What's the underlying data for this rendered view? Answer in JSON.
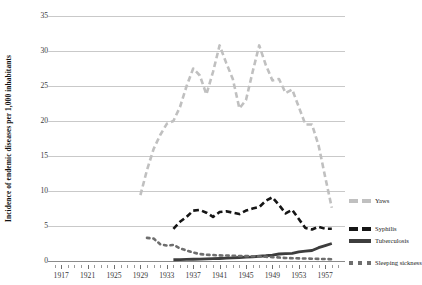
{
  "chart_data": {
    "type": "line",
    "title": "",
    "xlabel": "",
    "ylabel": "Incidence of endemic diseases per 1,000 inhabitants",
    "xlim": [
      1915,
      1960
    ],
    "ylim": [
      0,
      35
    ],
    "y_ticks": [
      0,
      5,
      10,
      15,
      20,
      25,
      30,
      35
    ],
    "x_ticks": [
      1917,
      1921,
      1925,
      1929,
      1933,
      1937,
      1941,
      1945,
      1949,
      1953,
      1957
    ],
    "x_minor_tick_interval": 1,
    "grid": "horizontal",
    "legend_position": "right",
    "series": [
      {
        "name": "Yaws",
        "color": "#c0c0c0",
        "style": "dashed",
        "width": 2.6,
        "x": [
          1929,
          1930,
          1931,
          1932,
          1933,
          1934,
          1935,
          1936,
          1937,
          1938,
          1939,
          1940,
          1941,
          1942,
          1943,
          1944,
          1945,
          1946,
          1947,
          1948,
          1949,
          1950,
          1951,
          1952,
          1953,
          1954,
          1955,
          1956,
          1957,
          1958
        ],
        "values": [
          9.4,
          13.0,
          16.0,
          18.0,
          19.6,
          20.0,
          22.0,
          25.0,
          27.5,
          26.5,
          23.8,
          27.0,
          30.8,
          28.3,
          26.0,
          21.8,
          23.0,
          27.0,
          30.8,
          28.0,
          25.8,
          26.0,
          24.0,
          24.5,
          22.0,
          19.5,
          19.5,
          16.5,
          12.0,
          7.6
        ]
      },
      {
        "name": "Syphilis",
        "color": "#151515",
        "style": "dashed",
        "width": 2.6,
        "x": [
          1934,
          1935,
          1936,
          1937,
          1938,
          1939,
          1940,
          1941,
          1942,
          1943,
          1944,
          1945,
          1946,
          1947,
          1948,
          1949,
          1950,
          1951,
          1952,
          1953,
          1954,
          1955,
          1956,
          1957,
          1958
        ],
        "values": [
          4.6,
          5.6,
          6.3,
          7.2,
          7.3,
          6.9,
          6.3,
          7.0,
          7.1,
          6.9,
          6.7,
          7.2,
          7.5,
          7.7,
          8.6,
          9.1,
          8.0,
          6.8,
          7.3,
          6.0,
          4.7,
          4.5,
          4.9,
          4.6,
          4.6
        ]
      },
      {
        "name": "Tuberculosis",
        "color": "#3d3d3d",
        "style": "solid",
        "width": 2.8,
        "x": [
          1934,
          1935,
          1936,
          1937,
          1938,
          1939,
          1940,
          1941,
          1942,
          1943,
          1944,
          1945,
          1946,
          1947,
          1948,
          1949,
          1950,
          1951,
          1952,
          1953,
          1954,
          1955,
          1956,
          1957,
          1958
        ],
        "values": [
          0.18,
          0.2,
          0.22,
          0.25,
          0.27,
          0.3,
          0.33,
          0.36,
          0.4,
          0.45,
          0.5,
          0.55,
          0.6,
          0.68,
          0.75,
          0.85,
          1.0,
          1.05,
          1.1,
          1.3,
          1.4,
          1.5,
          1.9,
          2.2,
          2.5
        ]
      },
      {
        "name": "Sleeping sickness",
        "color": "#6e6e6e",
        "style": "dotted",
        "width": 2.6,
        "x": [
          1930,
          1931,
          1932,
          1933,
          1934,
          1935,
          1936,
          1937,
          1938,
          1939,
          1940,
          1941,
          1942,
          1943,
          1944,
          1945,
          1946,
          1947,
          1948,
          1949,
          1950,
          1951,
          1952,
          1953,
          1954,
          1955,
          1956,
          1957,
          1958
        ],
        "values": [
          3.3,
          3.2,
          2.4,
          2.2,
          2.3,
          1.8,
          1.5,
          1.2,
          1.0,
          0.9,
          0.85,
          0.8,
          0.78,
          0.75,
          0.72,
          0.7,
          0.68,
          0.65,
          0.6,
          0.55,
          0.5,
          0.42,
          0.4,
          0.38,
          0.35,
          0.33,
          0.3,
          0.28,
          0.25
        ]
      }
    ]
  },
  "legend": {
    "items": [
      {
        "label": "Yaws"
      },
      {
        "label": "Syphilis"
      },
      {
        "label": "Tuberculosis"
      },
      {
        "label": "Sleeping sickness"
      }
    ]
  }
}
